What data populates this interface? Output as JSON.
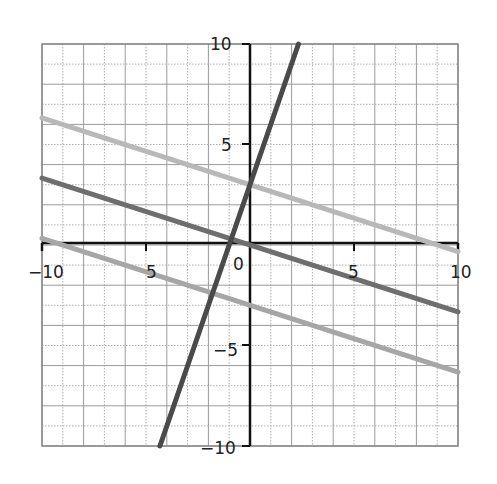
{
  "chart_data": {
    "type": "line",
    "title": "",
    "xlabel": "",
    "ylabel": "",
    "xlim": [
      -10,
      10
    ],
    "ylim": [
      -10,
      10
    ],
    "grid": true,
    "minor_grid": true,
    "legend": null,
    "x_tick_labels": [
      "-10",
      "-5",
      "0",
      "5",
      "10"
    ],
    "y_tick_labels": [
      "10",
      "5",
      "-5",
      "-10"
    ],
    "series": [
      {
        "name": "y = -x/3 + 3",
        "color": "#b8b8b8",
        "x": [
          -10,
          10
        ],
        "y": [
          6.33,
          -0.33
        ]
      },
      {
        "name": "y = -x/3",
        "color": "#6e6e6e",
        "x": [
          -10,
          10
        ],
        "y": [
          3.33,
          -3.33
        ]
      },
      {
        "name": "y = -x/3 - 3",
        "color": "#a6a6a6",
        "x": [
          -10,
          10
        ],
        "y": [
          0.33,
          -6.33
        ]
      },
      {
        "name": "y = 3x + 3",
        "color": "#4a4a4a",
        "x": [
          -4.33,
          2.33
        ],
        "y": [
          -10,
          10
        ]
      }
    ]
  },
  "labels": {
    "x_neg10": "−10",
    "x_neg5": "5",
    "x_0": "0",
    "x_5": "5",
    "x_10": "10",
    "y_10": "10",
    "y_5": "5",
    "y_neg5": "−5",
    "y_neg10": "−10"
  }
}
